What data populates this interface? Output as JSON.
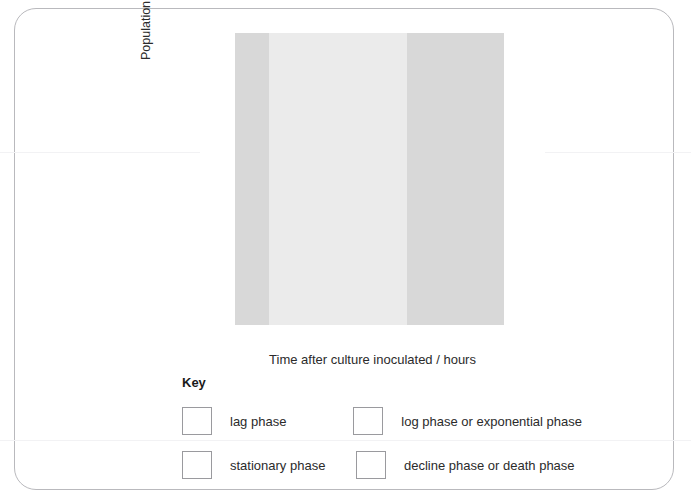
{
  "axes": {
    "y_title_main": "Population / cell number x 10",
    "y_title_exp1": "6",
    "y_title_mid": " cm",
    "y_title_exp2": "-3",
    "x_title": "Time after culture inoculated / hours"
  },
  "key": {
    "title": "Key",
    "entries": [
      {
        "label": "lag phase",
        "color": "#ffffff"
      },
      {
        "label": "log phase or exponential phase",
        "color": "#d8d8d8"
      },
      {
        "label": "stationary phase",
        "color": "#ebebeb"
      },
      {
        "label": "decline phase or death phase",
        "color": "#d8d8d8"
      }
    ]
  },
  "chart_data": {
    "type": "line",
    "title": "",
    "xlabel": "Time after culture inoculated / hours",
    "ylabel": "Population / cell number x 10^6 cm^-3",
    "xlim": [
      0,
      50
    ],
    "ylim": [
      0,
      600
    ],
    "xticks": [
      0,
      10,
      20,
      30,
      40,
      50
    ],
    "yticks": [
      0,
      100,
      200,
      300,
      400,
      500,
      600
    ],
    "grid": true,
    "legend_position": "below-plot",
    "series": [
      {
        "name": "bacterial population",
        "marker": "x",
        "x": [
          2,
          3,
          4,
          5,
          6,
          9,
          11,
          14,
          19,
          30,
          34,
          39,
          44
        ],
        "y": [
          4,
          5,
          6,
          8,
          14,
          420,
          515,
          515,
          513,
          515,
          170,
          8,
          3
        ]
      }
    ],
    "curve": [
      {
        "x": 0,
        "y": 3
      },
      {
        "x": 2,
        "y": 4
      },
      {
        "x": 3,
        "y": 5
      },
      {
        "x": 4,
        "y": 6
      },
      {
        "x": 5,
        "y": 8
      },
      {
        "x": 5.8,
        "y": 14
      },
      {
        "x": 6.6,
        "y": 40
      },
      {
        "x": 7.2,
        "y": 110
      },
      {
        "x": 7.8,
        "y": 240
      },
      {
        "x": 8.4,
        "y": 370
      },
      {
        "x": 9.0,
        "y": 440
      },
      {
        "x": 9.6,
        "y": 490
      },
      {
        "x": 10.3,
        "y": 510
      },
      {
        "x": 11,
        "y": 515
      },
      {
        "x": 14,
        "y": 515
      },
      {
        "x": 19,
        "y": 513
      },
      {
        "x": 26,
        "y": 514
      },
      {
        "x": 30,
        "y": 515
      },
      {
        "x": 31,
        "y": 510
      },
      {
        "x": 31.8,
        "y": 488
      },
      {
        "x": 32.6,
        "y": 420
      },
      {
        "x": 33.4,
        "y": 310
      },
      {
        "x": 34,
        "y": 225
      },
      {
        "x": 34.6,
        "y": 160
      },
      {
        "x": 35.4,
        "y": 105
      },
      {
        "x": 36.4,
        "y": 62
      },
      {
        "x": 37.6,
        "y": 32
      },
      {
        "x": 39,
        "y": 13
      },
      {
        "x": 41,
        "y": 6
      },
      {
        "x": 44,
        "y": 3
      },
      {
        "x": 50,
        "y": 2
      }
    ],
    "phase_bands": [
      {
        "name": "lag phase",
        "x_start": 0,
        "x_end": 5,
        "color": "#ffffff"
      },
      {
        "name": "log phase or exponential phase",
        "x_start": 5,
        "x_end": 10,
        "color": "#d8d8d8"
      },
      {
        "name": "stationary phase",
        "x_start": 10,
        "x_end": 30,
        "color": "#ebebeb"
      },
      {
        "name": "decline phase or death phase",
        "x_start": 30,
        "x_end": 44,
        "color": "#d8d8d8"
      },
      {
        "name": "unshaded",
        "x_start": 44,
        "x_end": 50,
        "color": "#ffffff"
      }
    ]
  }
}
